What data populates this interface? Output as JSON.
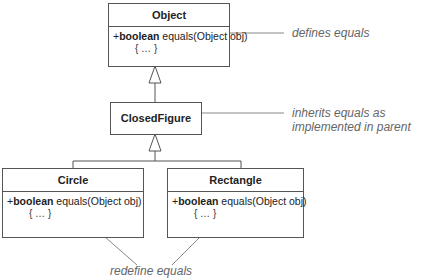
{
  "classes": {
    "object": {
      "name": "Object",
      "method": {
        "visibility": "+",
        "return_type": "boolean",
        "signature": " equals(Object obj)",
        "body": "{ … }"
      }
    },
    "closed_figure": {
      "name": "ClosedFigure"
    },
    "circle": {
      "name": "Circle",
      "method": {
        "visibility": "+",
        "return_type": "boolean",
        "signature": " equals(Object obj)",
        "body": "{ … }"
      }
    },
    "rectangle": {
      "name": "Rectangle",
      "method": {
        "visibility": "+",
        "return_type": "boolean",
        "signature": " equals(Object obj)",
        "body": "{ … }"
      }
    }
  },
  "notes": {
    "object_note": "defines equals",
    "closed_figure_note_line1": "inherits equals as",
    "closed_figure_note_line2": "implemented in parent",
    "subclasses_note": "redefine equals"
  },
  "colors": {
    "line": "#555555",
    "note_text": "#666666"
  }
}
